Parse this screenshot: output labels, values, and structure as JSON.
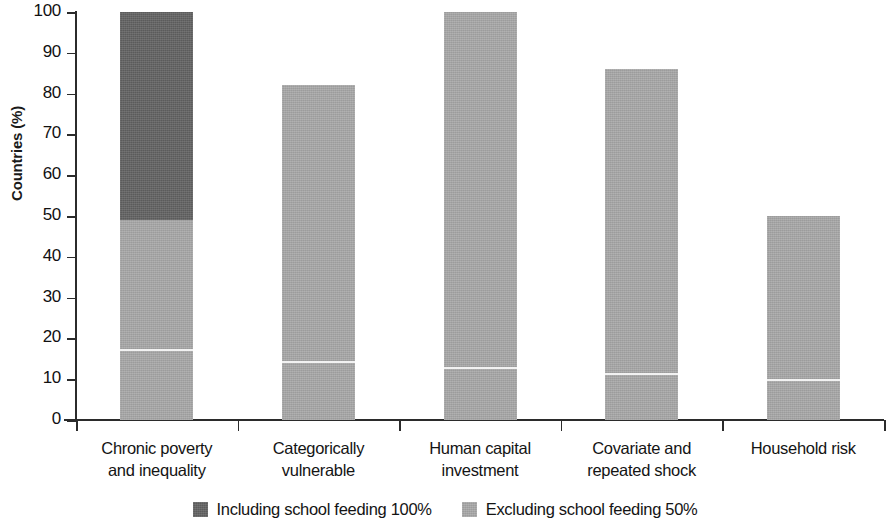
{
  "chart_data": {
    "type": "bar",
    "title": "",
    "subtitle": "",
    "xlabel": "",
    "ylabel": "Countries (%)",
    "ylim": [
      0,
      100
    ],
    "yticks": [
      0,
      10,
      20,
      30,
      40,
      50,
      60,
      70,
      80,
      90,
      100
    ],
    "ytick_labels": [
      "0",
      "10",
      "20",
      "30",
      "40",
      "50",
      "60",
      "70",
      "80",
      "90",
      "100"
    ],
    "grid": false,
    "legend_position": "bottom",
    "stacked": true,
    "categories": [
      "Chronic poverty and inequality",
      "Categorically vulnerable",
      "Human capital investment",
      "Covariate and repeated shock",
      "Household risk"
    ],
    "category_lines": [
      [
        "Chronic poverty",
        "and inequality"
      ],
      [
        "Categorically",
        "vulnerable"
      ],
      [
        "Human capital",
        "investment"
      ],
      [
        "Covariate and",
        "repeated shock"
      ],
      [
        "Household risk"
      ]
    ],
    "series": [
      {
        "name": "Including school feeding 100%",
        "color": "#636363",
        "values": [
          100,
          0,
          0,
          0,
          0
        ]
      },
      {
        "name": "Excluding school feeding 50%",
        "color": "#a8a8a8",
        "values": [
          49,
          82,
          100,
          86,
          50
        ]
      }
    ],
    "marker_lines": {
      "description": "thin white rule inside each bar",
      "values": [
        17,
        14,
        12.5,
        11,
        9.5
      ]
    },
    "bars": [
      {
        "category": "Chronic poverty and inequality",
        "total": 100,
        "light_top": 49,
        "marker": 17
      },
      {
        "category": "Categorically vulnerable",
        "total": 82,
        "light_top": 82,
        "marker": 14
      },
      {
        "category": "Human capital investment",
        "total": 100,
        "light_top": 100,
        "marker": 12.5
      },
      {
        "category": "Covariate and repeated shock",
        "total": 86,
        "light_top": 86,
        "marker": 11
      },
      {
        "category": "Household risk",
        "total": 50,
        "light_top": 50,
        "marker": 9.5
      }
    ]
  },
  "legend": {
    "items": [
      {
        "label": "Including school feeding 100%",
        "color": "#636363"
      },
      {
        "label": "Excluding school feeding 50%",
        "color": "#a8a8a8"
      }
    ]
  }
}
